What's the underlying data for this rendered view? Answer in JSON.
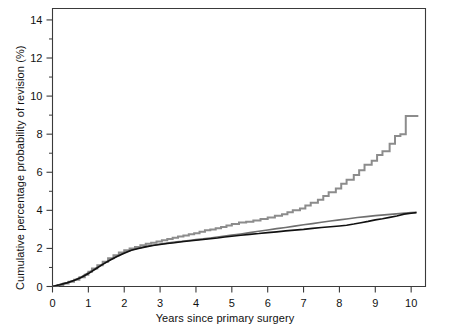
{
  "figure": {
    "background": "#ffffff",
    "axis_color": "#3a3a3a",
    "x_axis_title": "Years since primary surgery",
    "y_axis_title": "Cumulative percentage probability of revision (%)"
  },
  "chart_data": {
    "type": "line",
    "title": "",
    "subtitle": "",
    "xlabel": "Years since primary surgery",
    "ylabel": "Cumulative percentage probability of revision (%)",
    "xlim": [
      0,
      10.4
    ],
    "ylim": [
      0,
      14.6
    ],
    "xticks": [
      0,
      1,
      2,
      3,
      4,
      5,
      6,
      7,
      8,
      9,
      10
    ],
    "xtick_labels": [
      "0",
      "1",
      "2",
      "3",
      "4",
      "5",
      "6",
      "7",
      "8",
      "9",
      "10"
    ],
    "yticks": [
      0,
      2,
      4,
      6,
      8,
      10,
      12,
      14
    ],
    "ytick_labels": [
      "0",
      "2",
      "4",
      "6",
      "8",
      "10",
      "12",
      "14"
    ],
    "y_minor_ticks": [
      1,
      3,
      5,
      7,
      9,
      11,
      13
    ],
    "grid": false,
    "legend": null,
    "annotations": [],
    "series": [
      {
        "name": "upper-gray-curve",
        "color": "#8c8c8c",
        "width": 2.0,
        "step": true,
        "points": [
          [
            0.0,
            0.0
          ],
          [
            0.15,
            0.08
          ],
          [
            0.3,
            0.16
          ],
          [
            0.45,
            0.25
          ],
          [
            0.6,
            0.35
          ],
          [
            0.75,
            0.48
          ],
          [
            0.9,
            0.62
          ],
          [
            1.0,
            0.78
          ],
          [
            1.1,
            0.95
          ],
          [
            1.25,
            1.12
          ],
          [
            1.4,
            1.3
          ],
          [
            1.55,
            1.48
          ],
          [
            1.7,
            1.64
          ],
          [
            1.85,
            1.78
          ],
          [
            2.0,
            1.9
          ],
          [
            2.15,
            2.0
          ],
          [
            2.3,
            2.08
          ],
          [
            2.45,
            2.16
          ],
          [
            2.6,
            2.24
          ],
          [
            2.75,
            2.3
          ],
          [
            2.9,
            2.36
          ],
          [
            3.05,
            2.43
          ],
          [
            3.2,
            2.5
          ],
          [
            3.35,
            2.56
          ],
          [
            3.5,
            2.62
          ],
          [
            3.65,
            2.68
          ],
          [
            3.8,
            2.74
          ],
          [
            3.95,
            2.8
          ],
          [
            4.1,
            2.88
          ],
          [
            4.25,
            2.95
          ],
          [
            4.4,
            3.0
          ],
          [
            4.55,
            3.06
          ],
          [
            4.7,
            3.12
          ],
          [
            4.85,
            3.2
          ],
          [
            5.0,
            3.28
          ],
          [
            5.2,
            3.36
          ],
          [
            5.4,
            3.4
          ],
          [
            5.6,
            3.46
          ],
          [
            5.8,
            3.54
          ],
          [
            6.0,
            3.62
          ],
          [
            6.2,
            3.72
          ],
          [
            6.4,
            3.8
          ],
          [
            6.55,
            3.9
          ],
          [
            6.7,
            4.0
          ],
          [
            6.9,
            4.1
          ],
          [
            7.05,
            4.25
          ],
          [
            7.2,
            4.4
          ],
          [
            7.4,
            4.55
          ],
          [
            7.55,
            4.75
          ],
          [
            7.7,
            4.95
          ],
          [
            7.9,
            5.15
          ],
          [
            8.05,
            5.4
          ],
          [
            8.2,
            5.6
          ],
          [
            8.4,
            5.85
          ],
          [
            8.55,
            6.1
          ],
          [
            8.7,
            6.4
          ],
          [
            8.9,
            6.6
          ],
          [
            9.05,
            6.9
          ],
          [
            9.2,
            7.1
          ],
          [
            9.4,
            7.5
          ],
          [
            9.55,
            7.9
          ],
          [
            9.7,
            8.0
          ],
          [
            9.85,
            8.95
          ],
          [
            10.2,
            8.95
          ]
        ]
      },
      {
        "name": "middle-gray-curve",
        "color": "#6f6f6f",
        "width": 1.6,
        "step": false,
        "points": [
          [
            0.0,
            0.0
          ],
          [
            0.2,
            0.1
          ],
          [
            0.4,
            0.2
          ],
          [
            0.6,
            0.33
          ],
          [
            0.8,
            0.5
          ],
          [
            1.0,
            0.72
          ],
          [
            1.2,
            0.95
          ],
          [
            1.4,
            1.18
          ],
          [
            1.6,
            1.4
          ],
          [
            1.8,
            1.6
          ],
          [
            2.0,
            1.78
          ],
          [
            2.2,
            1.92
          ],
          [
            2.4,
            2.02
          ],
          [
            2.6,
            2.1
          ],
          [
            2.8,
            2.17
          ],
          [
            3.0,
            2.23
          ],
          [
            3.2,
            2.28
          ],
          [
            3.4,
            2.33
          ],
          [
            3.6,
            2.37
          ],
          [
            3.8,
            2.42
          ],
          [
            4.0,
            2.46
          ],
          [
            4.2,
            2.5
          ],
          [
            4.4,
            2.55
          ],
          [
            4.6,
            2.6
          ],
          [
            4.8,
            2.65
          ],
          [
            5.0,
            2.7
          ],
          [
            5.25,
            2.76
          ],
          [
            5.5,
            2.83
          ],
          [
            5.75,
            2.9
          ],
          [
            6.0,
            2.97
          ],
          [
            6.25,
            3.04
          ],
          [
            6.5,
            3.1
          ],
          [
            6.75,
            3.17
          ],
          [
            7.0,
            3.24
          ],
          [
            7.25,
            3.3
          ],
          [
            7.5,
            3.37
          ],
          [
            7.75,
            3.44
          ],
          [
            8.0,
            3.5
          ],
          [
            8.25,
            3.56
          ],
          [
            8.5,
            3.62
          ],
          [
            8.75,
            3.67
          ],
          [
            9.0,
            3.72
          ],
          [
            9.25,
            3.76
          ],
          [
            9.5,
            3.8
          ],
          [
            9.75,
            3.84
          ],
          [
            10.0,
            3.88
          ],
          [
            10.15,
            3.9
          ]
        ]
      },
      {
        "name": "black-curve",
        "color": "#111111",
        "width": 1.6,
        "step": false,
        "points": [
          [
            0.0,
            0.0
          ],
          [
            0.2,
            0.09
          ],
          [
            0.4,
            0.19
          ],
          [
            0.6,
            0.31
          ],
          [
            0.8,
            0.47
          ],
          [
            1.0,
            0.68
          ],
          [
            1.2,
            0.92
          ],
          [
            1.4,
            1.16
          ],
          [
            1.6,
            1.38
          ],
          [
            1.8,
            1.58
          ],
          [
            2.0,
            1.75
          ],
          [
            2.2,
            1.9
          ],
          [
            2.4,
            2.0
          ],
          [
            2.6,
            2.08
          ],
          [
            2.8,
            2.15
          ],
          [
            3.0,
            2.21
          ],
          [
            3.2,
            2.26
          ],
          [
            3.4,
            2.3
          ],
          [
            3.6,
            2.35
          ],
          [
            3.8,
            2.39
          ],
          [
            4.0,
            2.43
          ],
          [
            4.2,
            2.47
          ],
          [
            4.4,
            2.51
          ],
          [
            4.6,
            2.55
          ],
          [
            4.8,
            2.6
          ],
          [
            5.0,
            2.64
          ],
          [
            5.25,
            2.69
          ],
          [
            5.5,
            2.74
          ],
          [
            5.75,
            2.78
          ],
          [
            6.0,
            2.83
          ],
          [
            6.25,
            2.87
          ],
          [
            6.5,
            2.92
          ],
          [
            6.75,
            2.96
          ],
          [
            7.0,
            3.0
          ],
          [
            7.25,
            3.05
          ],
          [
            7.5,
            3.1
          ],
          [
            7.75,
            3.14
          ],
          [
            8.0,
            3.18
          ],
          [
            8.2,
            3.22
          ],
          [
            8.4,
            3.28
          ],
          [
            8.6,
            3.35
          ],
          [
            8.8,
            3.42
          ],
          [
            9.0,
            3.5
          ],
          [
            9.2,
            3.56
          ],
          [
            9.4,
            3.63
          ],
          [
            9.6,
            3.7
          ],
          [
            9.8,
            3.8
          ],
          [
            10.0,
            3.85
          ],
          [
            10.15,
            3.88
          ]
        ]
      }
    ]
  }
}
